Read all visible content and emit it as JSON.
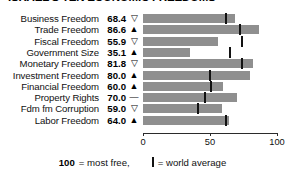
{
  "chart_data": {
    "type": "bar",
    "title": "ISRAEL'S TEN ECONOMIC FREEDOMS",
    "xlabel": "",
    "ylabel": "",
    "xlim": [
      0,
      100
    ],
    "grid": false,
    "orientation": "horizontal",
    "categories": [
      "Business Freedom",
      "Trade Freedom",
      "Fiscal Freedom",
      "Government Size",
      "Monetary Freedom",
      "Investment Freedom",
      "Financial Freedom",
      "Property Rights",
      "Fdm fm Corruption",
      "Labor Freedom"
    ],
    "values": [
      68.4,
      86.6,
      55.9,
      35.1,
      81.8,
      80.0,
      60.0,
      70.0,
      59.0,
      64.0
    ],
    "value_labels": [
      "68.4",
      "86.6",
      "55.9",
      "35.1",
      "81.8",
      "80.0",
      "60.0",
      "70.0",
      "59.0",
      "64.0"
    ],
    "trend_indicators": [
      "down",
      "up",
      "down",
      "up",
      "down",
      "up",
      "up",
      "flat",
      "down",
      "up"
    ],
    "trend_glyphs": [
      "▽",
      "▲",
      "▽",
      "▲",
      "▽",
      "▲",
      "▲",
      "—",
      "▽",
      "▲"
    ],
    "world_average": [
      62.0,
      72.5,
      74.0,
      65.0,
      73.8,
      50.0,
      51.0,
      46.0,
      41.0,
      62.0
    ],
    "ticks": [
      0,
      50,
      100
    ],
    "tick_labels": [
      "0",
      "50",
      "100"
    ],
    "legend": {
      "scale_value": "100",
      "scale_text": "= most free,",
      "avg_text": "= world average"
    },
    "colors": {
      "bar": "#8f8f8f",
      "marker": "#121212",
      "text": "#111111",
      "axis": "#2b2b2b",
      "background": "#ffffff"
    }
  }
}
